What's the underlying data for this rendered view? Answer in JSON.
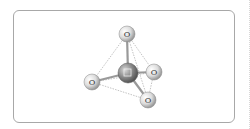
{
  "diagram": {
    "title": "",
    "type": "tetrahedral molecule ball-and-stick",
    "center_atom": {
      "label": "",
      "x": 128,
      "y": 73,
      "r": 10,
      "color": "#8c8c8c"
    },
    "ligand_atoms": [
      {
        "label": "O",
        "x": 127,
        "y": 34
      },
      {
        "label": "O",
        "x": 92,
        "y": 82
      },
      {
        "label": "O",
        "x": 154,
        "y": 72
      },
      {
        "label": "O",
        "x": 148,
        "y": 100
      }
    ],
    "ligand_radius": 8,
    "ligand_color": "#dcdcdc",
    "bond_color": "#9a9a9a",
    "tetrahedron_edge_color": "#9a9a9a"
  }
}
